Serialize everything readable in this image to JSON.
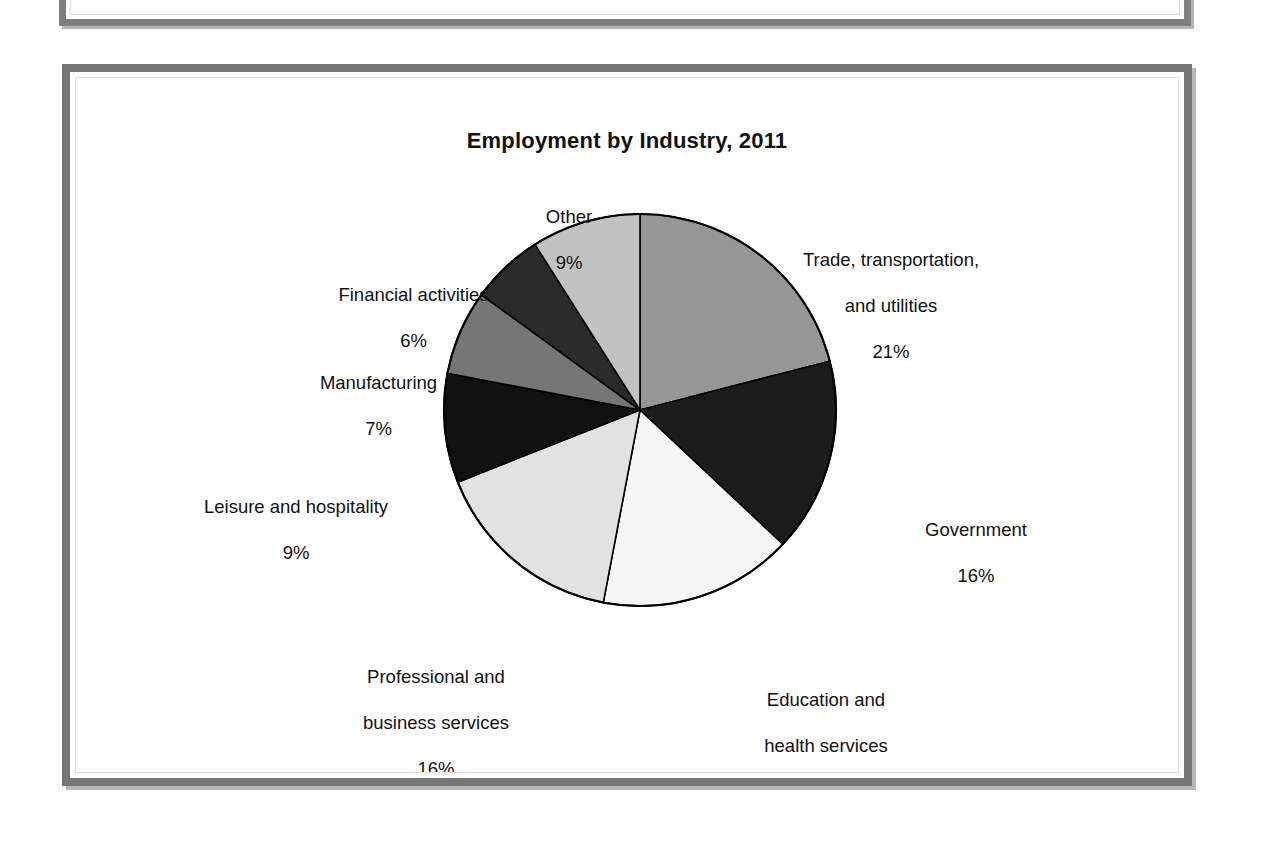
{
  "chart_data": {
    "type": "pie",
    "title": "Employment by Industry, 2011",
    "xlabel": "",
    "ylabel": "",
    "legend_position": "none",
    "labels_inline": true,
    "start_angle_deg": 0,
    "direction": "clockwise",
    "categories": [
      "Trade, transportation, and utilities",
      "Government",
      "Education and health services",
      "Professional and business services",
      "Leisure and hospitality",
      "Manufacturing",
      "Financial activities",
      "Other"
    ],
    "values": [
      21,
      16,
      16,
      16,
      9,
      7,
      6,
      9
    ],
    "value_unit": "%",
    "slices": [
      {
        "label": "Trade, transportation,\nand utilities",
        "label_line1": "Trade, transportation,",
        "label_line2": "and utilities",
        "value": 21,
        "value_text": "21%",
        "color": "#969696"
      },
      {
        "label": "Government",
        "label_line1": "Government",
        "label_line2": "",
        "value": 16,
        "value_text": "16%",
        "color": "#1c1c1c"
      },
      {
        "label": "Education and\nhealth services",
        "label_line1": "Education and",
        "label_line2": "health services",
        "value": 16,
        "value_text": "16%",
        "color": "#f6f6f6"
      },
      {
        "label": "Professional and\nbusiness services",
        "label_line1": "Professional and",
        "label_line2": "business services",
        "value": 16,
        "value_text": "16%",
        "color": "#e2e2e2"
      },
      {
        "label": "Leisure and hospitality",
        "label_line1": "Leisure and hospitality",
        "label_line2": "",
        "value": 9,
        "value_text": "9%",
        "color": "#111111"
      },
      {
        "label": "Manufacturing",
        "label_line1": "Manufacturing",
        "label_line2": "",
        "value": 7,
        "value_text": "7%",
        "color": "#767676"
      },
      {
        "label": "Financial activities",
        "label_line1": "Financial activities",
        "label_line2": "",
        "value": 6,
        "value_text": "6%",
        "color": "#2b2b2b"
      },
      {
        "label": "Other",
        "label_line1": "Other",
        "label_line2": "",
        "value": 9,
        "value_text": "9%",
        "color": "#c2c2c2"
      }
    ],
    "stroke_color": "#000000",
    "background": "#ffffff"
  },
  "page": {
    "frame_color": "#777777",
    "frame_shadow_color": "#b8b8b8",
    "background": "#ffffff"
  }
}
